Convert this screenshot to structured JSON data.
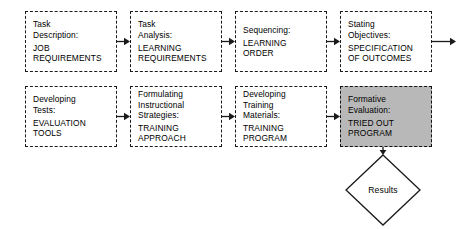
{
  "diagram": {
    "background_color": "#ffffff",
    "line_color": "#1a1a1a",
    "shaded_fill": "#b8b8b8",
    "nodes": [
      {
        "id": "task-description",
        "name": "task-description-box",
        "shaded": false,
        "lines": [
          "Task",
          "Description:"
        ],
        "emphasis_lines": [
          "JOB",
          "REQUIREMENTS"
        ],
        "x": 25,
        "y": 11,
        "w": 92,
        "h": 61
      },
      {
        "id": "task-analysis",
        "name": "task-analysis-box",
        "shaded": false,
        "lines": [
          "Task",
          "Analysis:"
        ],
        "emphasis_lines": [
          "LEARNING",
          "REQUIREMENTS"
        ],
        "x": 130,
        "y": 11,
        "w": 92,
        "h": 61
      },
      {
        "id": "sequencing",
        "name": "sequencing-box",
        "shaded": false,
        "lines": [
          "Sequencing:"
        ],
        "emphasis_lines": [
          "LEARNING",
          "ORDER"
        ],
        "x": 235,
        "y": 11,
        "w": 92,
        "h": 61
      },
      {
        "id": "stating-objectives",
        "name": "stating-objectives-box",
        "shaded": false,
        "lines": [
          "Stating",
          "Objectives:"
        ],
        "emphasis_lines": [
          "SPECIFICATION",
          "OF OUTCOMES"
        ],
        "x": 340,
        "y": 11,
        "w": 92,
        "h": 61
      },
      {
        "id": "developing-tests",
        "name": "developing-tests-box",
        "shaded": false,
        "lines": [
          "Developing",
          "Tests:"
        ],
        "emphasis_lines": [
          "EVALUATION",
          "TOOLS"
        ],
        "x": 25,
        "y": 86,
        "w": 92,
        "h": 61
      },
      {
        "id": "formulating-strategies",
        "name": "formulating-instructional-strategies-box",
        "shaded": false,
        "lines": [
          "Formulating",
          "Instructional",
          "Strategies:"
        ],
        "emphasis_lines": [
          "TRAINING",
          "APPROACH"
        ],
        "x": 130,
        "y": 86,
        "w": 92,
        "h": 61
      },
      {
        "id": "developing-materials",
        "name": "developing-training-materials-box",
        "shaded": false,
        "lines": [
          "Developing",
          "Training",
          "Materials:"
        ],
        "emphasis_lines": [
          "TRAINING",
          "PROGRAM"
        ],
        "x": 235,
        "y": 86,
        "w": 92,
        "h": 61
      },
      {
        "id": "formative-evaluation",
        "name": "formative-evaluation-box",
        "shaded": true,
        "lines": [
          "Formative",
          "Evaluation:"
        ],
        "emphasis_lines": [
          "TRIED OUT",
          "PROGRAM"
        ],
        "x": 340,
        "y": 86,
        "w": 92,
        "h": 61
      }
    ],
    "decision": {
      "id": "results",
      "name": "results-diamond",
      "label": "Results",
      "cx": 383,
      "cy": 190,
      "rx": 38,
      "ry": 36
    },
    "connectors": [
      {
        "name": "arrow-task-description-to-task-analysis",
        "from": "task-description",
        "to": "task-analysis",
        "x": 117,
        "y": 41,
        "len": 13,
        "dir": "right"
      },
      {
        "name": "arrow-task-analysis-to-sequencing",
        "from": "task-analysis",
        "to": "sequencing",
        "x": 222,
        "y": 41,
        "len": 13,
        "dir": "right"
      },
      {
        "name": "arrow-sequencing-to-stating-objectives",
        "from": "sequencing",
        "to": "stating-objectives",
        "x": 327,
        "y": 41,
        "len": 13,
        "dir": "right"
      },
      {
        "name": "arrow-stating-objectives-to-next-phase",
        "from": "stating-objectives",
        "to": "",
        "x": 432,
        "y": 41,
        "len": 24,
        "dir": "right"
      },
      {
        "name": "arrow-developing-tests-to-formulating-strategies",
        "from": "developing-tests",
        "to": "formulating-strategies",
        "x": 117,
        "y": 116,
        "len": 13,
        "dir": "right"
      },
      {
        "name": "arrow-formulating-strategies-to-developing-materials",
        "from": "formulating-strategies",
        "to": "developing-materials",
        "x": 222,
        "y": 116,
        "len": 13,
        "dir": "right"
      },
      {
        "name": "arrow-developing-materials-to-formative-evaluation",
        "from": "developing-materials",
        "to": "formative-evaluation",
        "x": 327,
        "y": 116,
        "len": 13,
        "dir": "right"
      },
      {
        "name": "arrow-formative-evaluation-to-results",
        "from": "formative-evaluation",
        "to": "results",
        "x": 383,
        "y": 147,
        "len": 8,
        "dir": "down"
      }
    ]
  }
}
